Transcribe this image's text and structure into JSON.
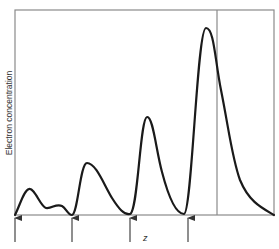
{
  "figure": {
    "y_axis_label": "Electron concentration",
    "x_axis_label": "z",
    "colors": {
      "frame": "#8a8a8a",
      "curve": "#1a1a1a",
      "arrow": "#333333"
    },
    "frame": {
      "left": 15,
      "top": 10,
      "right": 274,
      "bottom": 215
    },
    "vertical_marker_x": 217,
    "arrow_positions_x": [
      15,
      72,
      130,
      188
    ],
    "curve_description": "Oscillating electron concentration along z with peaks of increasing height; last peak near the vertical marker, then decays to zero at the right edge",
    "peaks": [
      {
        "x": 29,
        "y": 189,
        "label": "peak-1"
      },
      {
        "x": 60,
        "y": 205,
        "label": "shoulder"
      },
      {
        "x": 86,
        "y": 163,
        "label": "peak-2"
      },
      {
        "x": 147,
        "y": 117,
        "label": "peak-3"
      },
      {
        "x": 207,
        "y": 28,
        "label": "peak-4"
      }
    ]
  }
}
